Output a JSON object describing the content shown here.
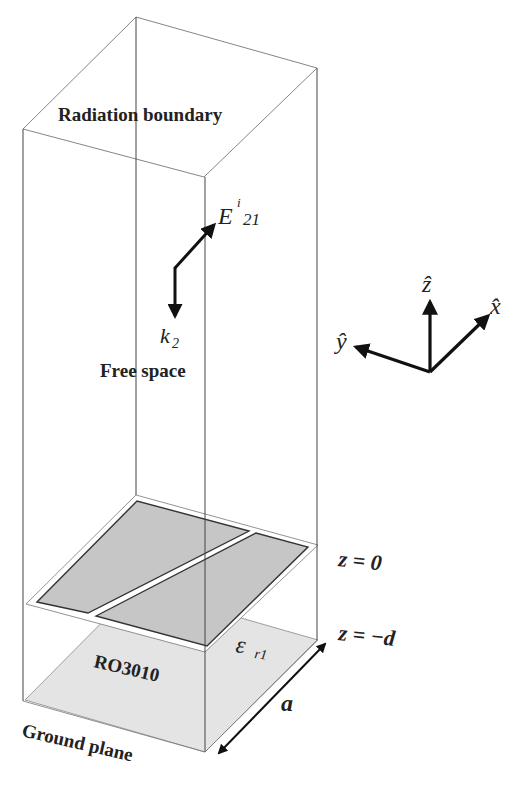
{
  "labels": {
    "radiation_boundary": "Radiation boundary",
    "free_space": "Free space",
    "e_field_main": "E",
    "e_field_sup": "i",
    "e_field_sub": "21",
    "k_vector_main": "k",
    "k_vector_sub": "2",
    "z_plane_top": "z = 0",
    "z_plane_bottom": "z = −d",
    "substrate_name": "RO3010",
    "permittivity_main": "ε",
    "permittivity_sub": "r1",
    "period_label": "a",
    "ground_plane": "Ground plane"
  },
  "axes": {
    "z_hat": "ẑ",
    "x_hat": "x̂",
    "y_hat": "ŷ"
  },
  "colors": {
    "line": "#333333",
    "thin_line": "#555555",
    "patch_fill": "#c8c8c8",
    "ground_fill": "#e2e2e2",
    "arrow": "#111111"
  }
}
